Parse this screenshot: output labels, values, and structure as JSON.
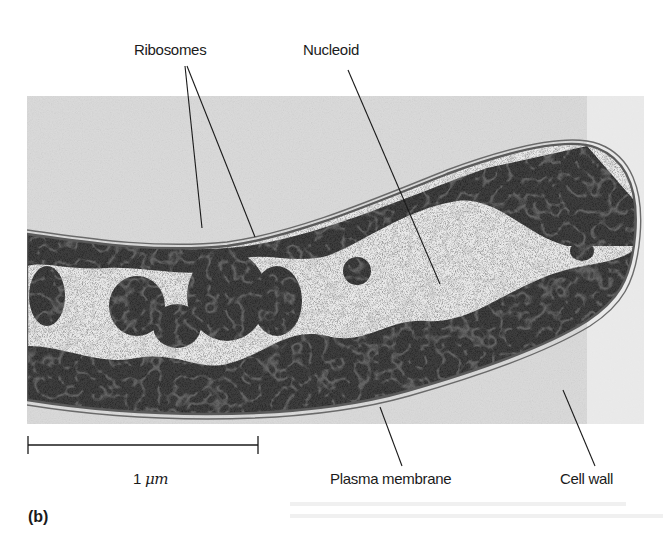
{
  "figure": {
    "panel_label": "(b)",
    "image_description": "Transmission electron micrograph of a rod-shaped bacterial cell in section",
    "labels": {
      "ribosomes": "Ribosomes",
      "nucleoid": "Nucleoid",
      "plasma_membrane": "Plasma membrane",
      "cell_wall": "Cell wall"
    },
    "scale_bar": {
      "value": "1",
      "unit": "μm"
    },
    "colors": {
      "background": "#ffffff",
      "micrograph_bg": "#d9d9d9",
      "cytoplasm_dense": "#3a3a3a",
      "nucleoid_light": "#ececec",
      "leader_line": "#1a1a1a"
    }
  }
}
